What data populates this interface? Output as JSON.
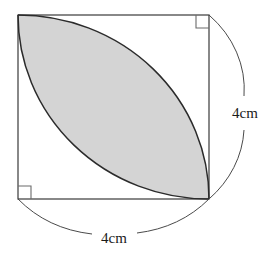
{
  "figure": {
    "shape_type": "geometry-diagram",
    "background_color": "#ffffff",
    "stroke_color": "#3a3a3a",
    "arc_stroke_color": "#2b2b2b",
    "shaded_fill_color": "#d4d4d4",
    "square": {
      "name": "outer-square",
      "left": 18,
      "top": 15,
      "right": 209,
      "bottom": 199,
      "side_length_label": "4cm"
    },
    "right_angle_markers": [
      {
        "name": "right-angle-top-right",
        "corner": "top-right",
        "size": 13
      },
      {
        "name": "right-angle-bottom-left",
        "corner": "bottom-left",
        "size": 13
      }
    ],
    "arcs": [
      {
        "name": "lens-arc-upper",
        "description": "quarter circle centred at bottom-left corner",
        "center": "bottom-left",
        "from": "top-left",
        "to": "bottom-right"
      },
      {
        "name": "lens-arc-lower",
        "description": "quarter circle centred at top-right corner",
        "center": "top-right",
        "from": "top-left",
        "to": "bottom-right"
      }
    ],
    "shaded_region": {
      "name": "shaded-lens",
      "description": "lens (vesica) formed by the two quarter-circle arcs"
    },
    "dimensions": [
      {
        "name": "dimension-right",
        "label": "4cm",
        "side": "right",
        "label_x": 245,
        "label_y": 113
      },
      {
        "name": "dimension-bottom",
        "label": "4cm",
        "side": "bottom",
        "label_x": 113,
        "label_y": 238
      }
    ]
  }
}
